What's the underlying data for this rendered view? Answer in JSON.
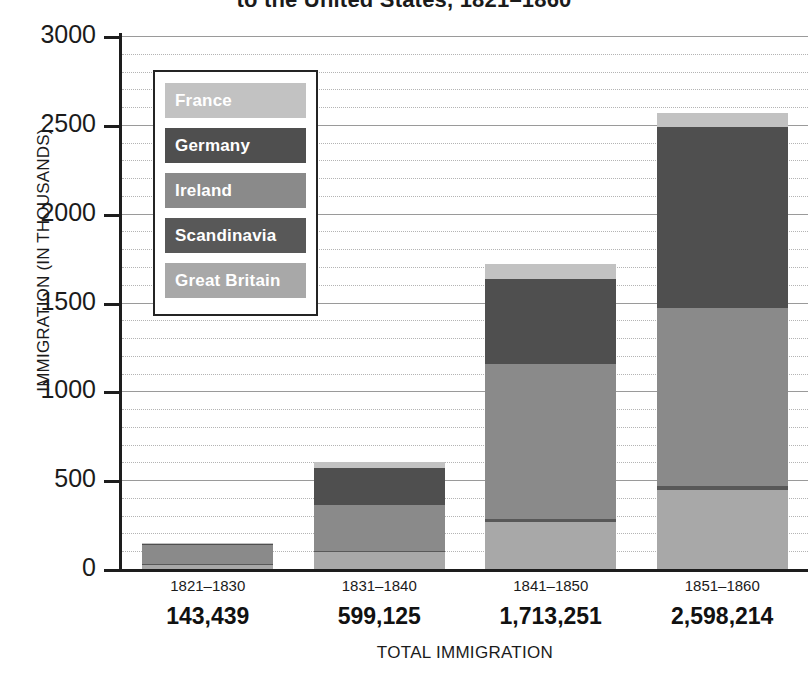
{
  "chart_data": {
    "type": "bar",
    "subtype": "stacked-bar",
    "title": "to the United States, 1821–1860",
    "xlabel": "TOTAL IMMIGRATION",
    "ylabel": "IMMIGRATION (IN THOUSANDS)",
    "categories": [
      "1821–1830",
      "1831–1840",
      "1841–1850",
      "1851–1860"
    ],
    "category_totals": [
      "143,439",
      "599,125",
      "1,713,251",
      "2,598,214"
    ],
    "ylim": [
      0,
      3000
    ],
    "yticks": [
      0,
      500,
      1000,
      1500,
      2000,
      2500,
      3000
    ],
    "ytick_labels": [
      "0",
      "500",
      "1000",
      "1500",
      "2000",
      "2500",
      "3000"
    ],
    "minor_tick_step": 100,
    "grid": true,
    "legend_position": "upper-left-inside",
    "stack_order_bottom_to_top": [
      "Great Britain",
      "Scandinavia",
      "Ireland",
      "Germany",
      "France"
    ],
    "series": [
      {
        "name": "Great Britain",
        "color": "#a8a8a8",
        "values": [
          27,
          95,
          267,
          445
        ]
      },
      {
        "name": "Scandinavia",
        "color": "#585858",
        "values": [
          3,
          5,
          14,
          25
        ]
      },
      {
        "name": "Ireland",
        "color": "#8a8a8a",
        "values": [
          111,
          260,
          871,
          1000
        ]
      },
      {
        "name": "Germany",
        "color": "#4f4f4f",
        "values": [
          2,
          210,
          480,
          1020
        ]
      },
      {
        "name": "France",
        "color": "#c2c2c2",
        "values": [
          1,
          30,
          84,
          78
        ]
      }
    ]
  },
  "legend": {
    "items": [
      {
        "label": "France",
        "color": "#c2c2c2"
      },
      {
        "label": "Germany",
        "color": "#4f4f4f"
      },
      {
        "label": "Ireland",
        "color": "#8a8a8a"
      },
      {
        "label": "Scandinavia",
        "color": "#585858"
      },
      {
        "label": "Great Britain",
        "color": "#a8a8a8"
      }
    ]
  },
  "colors": {
    "axis": "#1d1d1d",
    "gridline_major": "#9a9a9a",
    "gridline_minor": "#b4b4b4",
    "background": "#ffffff",
    "text": "#1b1b1b"
  }
}
